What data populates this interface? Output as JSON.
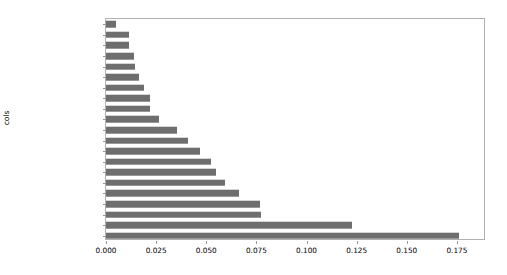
{
  "chart_data": {
    "type": "bar",
    "orientation": "horizontal",
    "title": "",
    "xlabel": "",
    "ylabel": "cols",
    "xlim": [
      0.0,
      0.1895
    ],
    "grid": false,
    "legend": null,
    "bar_color": "#6e6e6e",
    "xticks": [
      0.0,
      0.025,
      0.05,
      0.075,
      0.1,
      0.125,
      0.15,
      0.175
    ],
    "xticklabels": [
      "0.000",
      "0.025",
      "0.050",
      "0.075",
      "0.100",
      "0.125",
      "0.150",
      "0.175"
    ],
    "categories": [
      "Drive_System",
      "ProductGroup",
      "ProductGroupDesc",
      "Tire_Size",
      "MachineID",
      "fiModelDescriptor",
      "Hydraulics",
      "saleYear",
      "fiBaseModel",
      "SalesID",
      "fiModelDesc",
      "Enclosure",
      "fiSecondaryDesc",
      "saleElapsed",
      "ModelID",
      "Hydraulics_Flow",
      "Coupler_System",
      "Grouser_Tracks",
      "fiProductClassDesc",
      "ProductSize",
      "YearMade"
    ],
    "values": [
      0.0048,
      0.0113,
      0.0113,
      0.0142,
      0.0144,
      0.0166,
      0.019,
      0.0217,
      0.022,
      0.0262,
      0.0355,
      0.041,
      0.0468,
      0.0526,
      0.055,
      0.0592,
      0.0665,
      0.077,
      0.0775,
      0.1228,
      0.176
    ]
  }
}
